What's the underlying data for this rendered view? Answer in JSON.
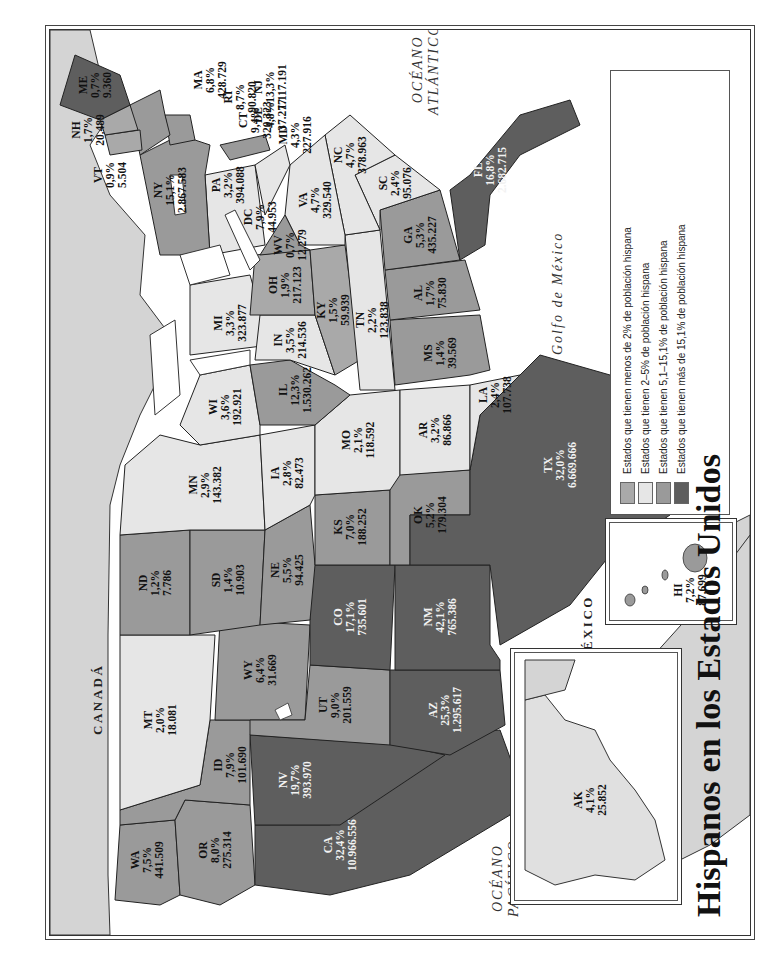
{
  "title": "Hispanos en los Estados Unidos",
  "geo_labels": {
    "canada": "CANADÁ",
    "mexico": "MÉXICO",
    "atlantic": "OCÉANO ATLÁNTICO",
    "atlantic_l1": "OCÉANO",
    "atlantic_l2": "ATLÁNTICO",
    "pacific_l1": "OCÉANO",
    "pacific_l2": "PACÍFICO",
    "gulf": "Golfo de México"
  },
  "colors": {
    "lt2": "#a9a9a9",
    "c2_5": "#e6e6e6",
    "c5_15": "#9a9a9a",
    "gt15": "#5e5e5e",
    "land_other": "#d4d4d4",
    "water": "#ffffff"
  },
  "legend": {
    "items": [
      {
        "label": "Estados que tienen menos de 2% de población hispana",
        "color": "#a9a9a9"
      },
      {
        "label": "Estados que tienen 2–5% de población hispana",
        "color": "#e6e6e6"
      },
      {
        "label": "Estados que tienen 5,1–15,1% de población hispana",
        "color": "#9a9a9a"
      },
      {
        "label": "Estados que tienen más de 15,1% de población hispana",
        "color": "#5e5e5e"
      }
    ],
    "note_label": "Nota:",
    "note_text": "El porcentaje es por estado. Así, para la Florida el 16,8% (2.682.715 personas) de la población estatal es hispana.",
    "total_label": "Hispanos en total:",
    "total_text": "12,5% (35,3 millones) de la población total de Estados Unidos",
    "source": "Fuente: U.S. Census 2000"
  },
  "states": [
    {
      "abbr": "WA",
      "pct": "7,5%",
      "pop": "441.509"
    },
    {
      "abbr": "OR",
      "pct": "8,0%",
      "pop": "275.314"
    },
    {
      "abbr": "CA",
      "pct": "32,4%",
      "pop": "10.966.556"
    },
    {
      "abbr": "NV",
      "pct": "19,7%",
      "pop": "393.970"
    },
    {
      "abbr": "ID",
      "pct": "7,9%",
      "pop": "101.690"
    },
    {
      "abbr": "MT",
      "pct": "2,0%",
      "pop": "18.081"
    },
    {
      "abbr": "WY",
      "pct": "6,4%",
      "pop": "31.669"
    },
    {
      "abbr": "UT",
      "pct": "9,0%",
      "pop": "201.559"
    },
    {
      "abbr": "AZ",
      "pct": "25,3%",
      "pop": "1.295.617"
    },
    {
      "abbr": "CO",
      "pct": "17,1%",
      "pop": "735.601"
    },
    {
      "abbr": "NM",
      "pct": "42,1%",
      "pop": "765.386"
    },
    {
      "abbr": "ND",
      "pct": "1,2%",
      "pop": "7.786"
    },
    {
      "abbr": "SD",
      "pct": "1,4%",
      "pop": "10.903"
    },
    {
      "abbr": "NE",
      "pct": "5,5%",
      "pop": "94.425"
    },
    {
      "abbr": "KS",
      "pct": "7,0%",
      "pop": "188.252"
    },
    {
      "abbr": "OK",
      "pct": "5,2%",
      "pop": "179.304"
    },
    {
      "abbr": "TX",
      "pct": "32,0%",
      "pop": "6.669.666"
    },
    {
      "abbr": "MN",
      "pct": "2,9%",
      "pop": "143.382"
    },
    {
      "abbr": "IA",
      "pct": "2,8%",
      "pop": "82.473"
    },
    {
      "abbr": "MO",
      "pct": "2,1%",
      "pop": "118.592"
    },
    {
      "abbr": "AR",
      "pct": "3,2%",
      "pop": "86.866"
    },
    {
      "abbr": "LA",
      "pct": "2,4%",
      "pop": "107.738"
    },
    {
      "abbr": "WI",
      "pct": "3,6%",
      "pop": "192.921"
    },
    {
      "abbr": "IL",
      "pct": "12,3%",
      "pop": "1.530.262"
    },
    {
      "abbr": "MI",
      "pct": "3,3%",
      "pop": "323.877"
    },
    {
      "abbr": "IN",
      "pct": "3,5%",
      "pop": "214.536"
    },
    {
      "abbr": "OH",
      "pct": "1,9%",
      "pop": "217.123"
    },
    {
      "abbr": "KY",
      "pct": "1,5%",
      "pop": "59.939"
    },
    {
      "abbr": "TN",
      "pct": "2,2%",
      "pop": "123.838"
    },
    {
      "abbr": "MS",
      "pct": "1,4%",
      "pop": "39.569"
    },
    {
      "abbr": "AL",
      "pct": "1,7%",
      "pop": "75.830"
    },
    {
      "abbr": "GA",
      "pct": "5,3%",
      "pop": "435.227"
    },
    {
      "abbr": "FL",
      "pct": "16,8%",
      "pop": "2.682.715"
    },
    {
      "abbr": "SC",
      "pct": "2,4%",
      "pop": "95.076"
    },
    {
      "abbr": "NC",
      "pct": "4,7%",
      "pop": "378.963"
    },
    {
      "abbr": "VA",
      "pct": "4,7%",
      "pop": "329.540"
    },
    {
      "abbr": "WV",
      "pct": "0,7%",
      "pop": "12.279"
    },
    {
      "abbr": "PA",
      "pct": "3,2%",
      "pop": "394.088"
    },
    {
      "abbr": "DC",
      "pct": "7,9%",
      "pop": "44.953"
    },
    {
      "abbr": "MD",
      "pct": "4,3%",
      "pop": "227.916"
    },
    {
      "abbr": "DE",
      "pct": "4,8%",
      "pop": "37.277"
    },
    {
      "abbr": "NJ",
      "pct": "13,3%",
      "pop": "1.117.191"
    },
    {
      "abbr": "NY",
      "pct": "15,1%",
      "pop": "2.867.583"
    },
    {
      "abbr": "CT",
      "pct": "9,4%",
      "pop": "320.323"
    },
    {
      "abbr": "RI",
      "pct": "8,7%",
      "pop": "90.820"
    },
    {
      "abbr": "MA",
      "pct": "6,8%",
      "pop": "428.729"
    },
    {
      "abbr": "VT",
      "pct": "0,9%",
      "pop": "5.504"
    },
    {
      "abbr": "NH",
      "pct": "1,7%",
      "pop": "20.489"
    },
    {
      "abbr": "ME",
      "pct": "0,7%",
      "pop": "9.360"
    },
    {
      "abbr": "AK",
      "pct": "4,1%",
      "pop": "25.852"
    },
    {
      "abbr": "HI",
      "pct": "7,2%",
      "pop": "87.699"
    }
  ]
}
